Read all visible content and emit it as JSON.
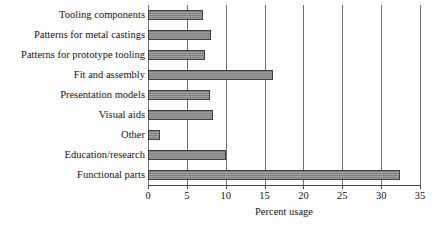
{
  "chart_data": {
    "type": "bar",
    "orientation": "horizontal",
    "title": "",
    "xlabel": "Percent usage",
    "ylabel": "",
    "xlim": [
      0,
      35
    ],
    "ylim": null,
    "xticks": [
      0,
      5,
      10,
      15,
      20,
      25,
      30,
      35
    ],
    "xticklabels": [
      "0",
      "5",
      "10",
      "15",
      "20",
      "25",
      "30",
      "35"
    ],
    "grid": "vertical-gridlines-at-xticks",
    "legend": "none",
    "bar_color": "#8a8a8a",
    "bar_edge_color": "#3d3d3d",
    "background_color": "#fefefe",
    "categories": [
      "Tooling components",
      "Patterns for metal castings",
      "Patterns for prototype tooling",
      "Fit and assembly",
      "Presentation models",
      "Visual aids",
      "Other",
      "Education/research",
      "Functional parts"
    ],
    "values": [
      7.1,
      8.1,
      7.3,
      16.1,
      8.0,
      8.3,
      1.5,
      10.0,
      32.4
    ]
  }
}
